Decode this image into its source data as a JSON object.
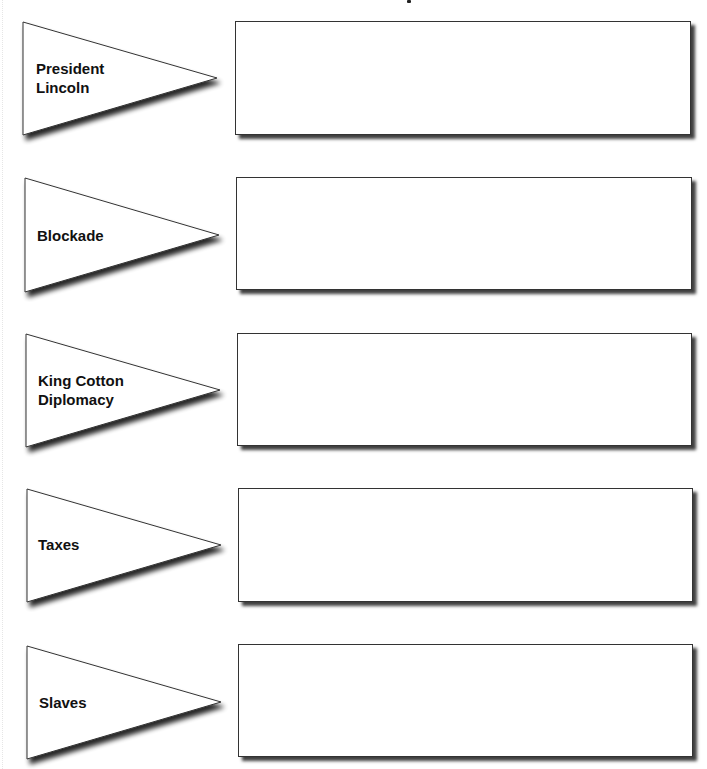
{
  "worksheet": {
    "rows": [
      {
        "label": "President\nLincoln",
        "answer": ""
      },
      {
        "label": "Blockade",
        "answer": ""
      },
      {
        "label": "King Cotton\nDiplomacy",
        "answer": ""
      },
      {
        "label": "Taxes",
        "answer": ""
      },
      {
        "label": "Slaves",
        "answer": ""
      }
    ]
  },
  "colors": {
    "outline": "#333333",
    "text": "#111111",
    "background": "#ffffff"
  }
}
